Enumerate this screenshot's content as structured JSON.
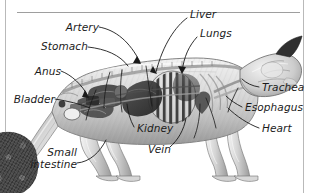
{
  "figure": {
    "title_alt": "Cat internal anatomy cutaway illustration",
    "style": "grayscale anatomical cutaway, side view, facing right",
    "frame": {
      "left_rule": true,
      "right_rule": true,
      "top_rule": true
    },
    "corner_fragment": {
      "name": "dark-textured-fragment",
      "position": "bottom-left",
      "color": "#4a4a4a"
    },
    "palette": {
      "background": "#ffffff",
      "text": "#1b1b1b",
      "leader_line": "#1a1a1a",
      "rule": "#b9b9b9",
      "rule_top": "#9e9e9e",
      "body_light": "#e9e9e9",
      "body_mid": "#bdbdbd",
      "body_dark": "#6f6f6f",
      "organ_dark": "#3a3a3a"
    },
    "labels": [
      {
        "id": "artery",
        "text": "Artery",
        "align": "right",
        "x": 96,
        "y": 27
      },
      {
        "id": "liver",
        "text": "Liver",
        "align": "left",
        "x": 190,
        "y": 14
      },
      {
        "id": "lungs",
        "text": "Lungs",
        "align": "left",
        "x": 200,
        "y": 33
      },
      {
        "id": "stomach",
        "text": "Stomach",
        "align": "right",
        "x": 44,
        "y": 42
      },
      {
        "id": "anus",
        "text": "Anus",
        "align": "right",
        "x": 35,
        "y": 67
      },
      {
        "id": "bladder",
        "text": "Bladder",
        "align": "right",
        "x": 12,
        "y": 95
      },
      {
        "id": "trachea",
        "text": "Trachea",
        "align": "left",
        "x": 262,
        "y": 83
      },
      {
        "id": "esophagus",
        "text": "Esophagus",
        "align": "left",
        "x": 245,
        "y": 103
      },
      {
        "id": "heart",
        "text": "Heart",
        "align": "left",
        "x": 262,
        "y": 124
      },
      {
        "id": "kidney",
        "text": "Kidney",
        "align": "left",
        "x": 137,
        "y": 124
      },
      {
        "id": "vein",
        "text": "Vein",
        "align": "left",
        "x": 148,
        "y": 145
      },
      {
        "id": "small-intestine",
        "text": "Small\nintestine",
        "align": "right",
        "x": 31,
        "y": 152
      }
    ]
  }
}
